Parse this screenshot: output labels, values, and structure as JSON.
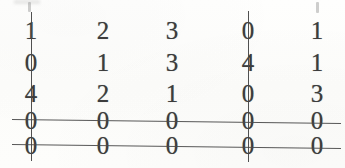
{
  "document": {
    "kind": "scanned-matrix",
    "ink_color": "#3c3c3c",
    "line_color": "#4a4a4a",
    "paper_color": "#fdfdfc"
  },
  "matrix": {
    "rows": 5,
    "columns": 5,
    "values": [
      [
        "1",
        "2",
        "3",
        "0",
        "1"
      ],
      [
        "0",
        "1",
        "3",
        "4",
        "1"
      ],
      [
        "4",
        "2",
        "1",
        "0",
        "3"
      ],
      [
        "0",
        "0",
        "0",
        "0",
        "0"
      ],
      [
        "0",
        "0",
        "0",
        "0",
        "0"
      ]
    ],
    "column_centers_px": [
      31,
      103,
      172,
      248,
      317
    ],
    "row_centers_px": [
      30,
      62,
      93,
      120,
      145
    ]
  },
  "annotations": {
    "horizontal_strikes": [
      {
        "label": "row-4-strike",
        "x1": 12,
        "y1": 119,
        "x2": 341,
        "y2": 123
      },
      {
        "label": "row-5-strike",
        "x1": 12,
        "y1": 144,
        "x2": 341,
        "y2": 148
      }
    ],
    "vertical_strikes": [
      {
        "label": "column-1-strike",
        "x": 31,
        "y1": 12,
        "y2": 161
      },
      {
        "label": "column-4-strike",
        "x": 248,
        "y1": 11,
        "y2": 162
      }
    ],
    "scan_artifacts": [
      {
        "label": "smudge-top-left",
        "x": 28,
        "y": 2,
        "width": 3,
        "height": 10
      },
      {
        "label": "smudge-top-left-wide",
        "x": 14,
        "y": 0,
        "width": 26,
        "height": 4
      },
      {
        "label": "smudge-top-right",
        "x": 316,
        "y": 2,
        "width": 3,
        "height": 11
      }
    ]
  }
}
